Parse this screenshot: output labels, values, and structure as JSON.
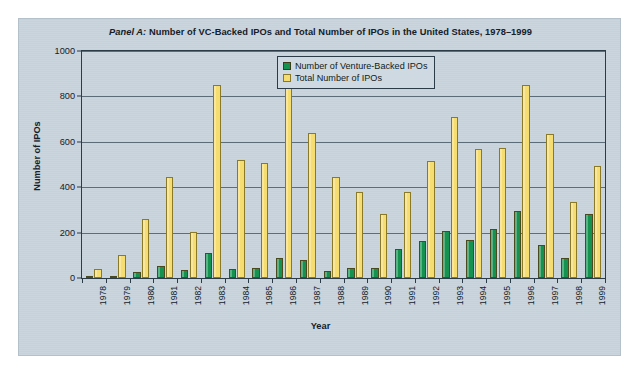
{
  "figure": {
    "panel_label": "Panel A:",
    "title_rest": " Number of VC-Backed IPOs and Total Number of IPOs in the United States, 1978–1999",
    "background_color": "#c8d3dc",
    "frame_color": "#2b3b47"
  },
  "legend": {
    "position": "top-center",
    "entries": [
      {
        "label": "Number of Venture-Backed IPOs",
        "color": "#159150",
        "icon": "square-swatch-icon"
      },
      {
        "label": "Total Number of IPOs",
        "color": "#f5dd72",
        "icon": "square-swatch-icon"
      }
    ]
  },
  "axes": {
    "ylabel": "Number of IPOs",
    "xlabel": "Year",
    "yticks": [
      "0",
      "200",
      "400",
      "600",
      "800",
      "1000"
    ],
    "ymin": 0,
    "ymax": 1000
  },
  "chart_data": {
    "type": "bar",
    "title": "Panel A: Number of VC-Backed IPOs and Total Number of IPOs in the United States, 1978–1999",
    "xlabel": "Year",
    "ylabel": "Number of IPOs",
    "ylim": [
      0,
      1000
    ],
    "ytick_step": 200,
    "grid": true,
    "legend_position": "top-center",
    "categories": [
      "1978",
      "1979",
      "1980",
      "1981",
      "1982",
      "1983",
      "1984",
      "1985",
      "1986",
      "1987",
      "1988",
      "1989",
      "1990",
      "1991",
      "1992",
      "1993",
      "1994",
      "1995",
      "1996",
      "1997",
      "1998",
      "1999"
    ],
    "series": [
      {
        "name": "Number of Venture-Backed IPOs",
        "color": "#159150",
        "values": [
          6,
          8,
          28,
          52,
          36,
          112,
          40,
          42,
          90,
          78,
          32,
          42,
          46,
          128,
          163,
          207,
          169,
          214,
          295,
          144,
          90,
          283
        ]
      },
      {
        "name": "Total Number of IPOs",
        "color": "#f5dd72",
        "values": [
          40,
          102,
          262,
          444,
          201,
          850,
          520,
          507,
          955,
          637,
          444,
          377,
          283,
          378,
          517,
          710,
          568,
          574,
          852,
          635,
          334,
          492
        ]
      }
    ]
  }
}
